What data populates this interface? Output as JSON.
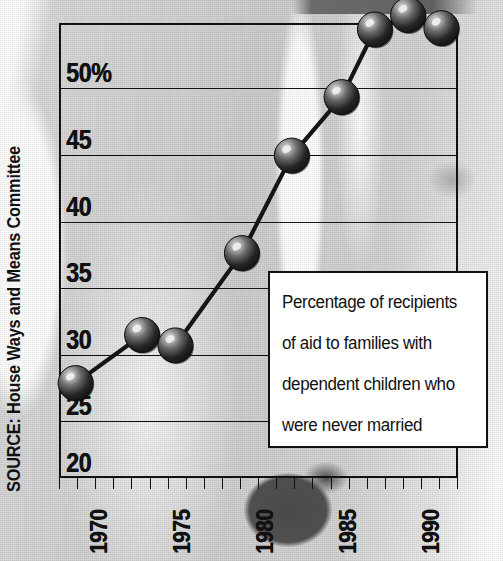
{
  "source_note": "SOURCE: House Ways and Means Committee",
  "caption": {
    "lines": [
      "Percentage of recipients",
      "of aid to families with",
      "dependent children who",
      "were never married"
    ]
  },
  "colors": {
    "ink": "#111111",
    "marker_dark": "#1a1a1a",
    "marker_highlight": "#d8d8d8",
    "panel": "#ffffff",
    "background_gray": "#cfcfcf"
  },
  "chart_data": {
    "type": "line",
    "title": "",
    "subtitle": "",
    "xlabel": "",
    "ylabel": "",
    "grid": true,
    "legend_position": "none",
    "xlim": [
      1969,
      1993
    ],
    "ylim": [
      20,
      55
    ],
    "ytick_labels": [
      "50%",
      "45",
      "40",
      "35",
      "30",
      "25",
      "20"
    ],
    "ytick_values": [
      50,
      45,
      40,
      35,
      30,
      25,
      20
    ],
    "xtick_labels": [
      "1970",
      "1975",
      "1980",
      "1985",
      "1990"
    ],
    "xtick_values": [
      1970,
      1975,
      1980,
      1985,
      1990
    ],
    "x_minor_tick_interval": 1,
    "series": [
      {
        "name": "Percentage of AFDC recipients never married",
        "x": [
          1970,
          1974,
          1976,
          1980,
          1983,
          1986,
          1988,
          1990,
          1992
        ],
        "values": [
          27.3,
          31.0,
          30.2,
          37.3,
          44.8,
          49.3,
          54.5,
          55.6,
          54.6
        ]
      }
    ],
    "annotations": [
      "Percentage of recipients of aid to families with dependent children who were never married"
    ],
    "source": "SOURCE: House Ways and Means Committee"
  },
  "axes_geometry": {
    "plot_left_px": 59,
    "plot_right_px": 458,
    "plot_top_px": 23,
    "plot_bottom_px": 478,
    "gridline_y_px": [
      88,
      155,
      222,
      288,
      355,
      421
    ],
    "x_tick_start_px": 59,
    "x_tick_spacing_px": 18.1,
    "x_tick_count": 23
  }
}
